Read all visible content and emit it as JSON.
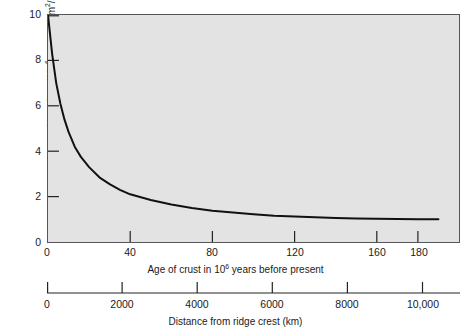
{
  "chart_data": {
    "type": "line",
    "title": "",
    "subtitle": "",
    "xlabel": "Age of crust in 10⁶ years before present",
    "ylabel": "Heat flow (10⁻⁶ calories/cm²/s)",
    "secondary_xlabel": "Distance from ridge crest (km)",
    "xlim": [
      0,
      200
    ],
    "ylim": [
      0,
      10
    ],
    "secondary_xlim": [
      0,
      11000
    ],
    "grid": false,
    "legend": null,
    "plot_background": "#e3e3e3",
    "line_color": "#111111",
    "x_ticks": [
      0,
      40,
      80,
      120,
      160,
      180
    ],
    "x_tick_labels": [
      "0",
      "40",
      "80",
      "120",
      "160",
      "180"
    ],
    "y_ticks": [
      0,
      2,
      4,
      6,
      8,
      10
    ],
    "y_tick_labels": [
      "0",
      "2",
      "4",
      "6",
      "8",
      "10"
    ],
    "secondary_x_ticks": [
      0,
      2000,
      4000,
      6000,
      8000,
      10000
    ],
    "secondary_x_tick_labels": [
      "0",
      "2000",
      "4000",
      "6000",
      "8000",
      "10,000"
    ],
    "series": [
      {
        "name": "Heat flow vs age of crust",
        "x": [
          0,
          2,
          4,
          6,
          8,
          10,
          13,
          16,
          20,
          25,
          30,
          35,
          40,
          50,
          60,
          70,
          80,
          90,
          100,
          110,
          120,
          130,
          140,
          150,
          160,
          170,
          180,
          190
        ],
        "y": [
          10.0,
          8.3,
          7.0,
          6.1,
          5.4,
          4.85,
          4.2,
          3.75,
          3.3,
          2.85,
          2.55,
          2.3,
          2.1,
          1.85,
          1.65,
          1.5,
          1.38,
          1.3,
          1.22,
          1.16,
          1.12,
          1.09,
          1.06,
          1.04,
          1.02,
          1.01,
          1.0,
          1.0
        ]
      }
    ],
    "annotations": []
  },
  "axes": {
    "y": {
      "title_prefix": "Heat flow (10",
      "title_exponent": "−6",
      "title_suffix": " calories/cm",
      "title_exponent2": "2",
      "title_tail": "/s)",
      "ticks": [
        "0",
        "2",
        "4",
        "6",
        "8",
        "10"
      ]
    },
    "age": {
      "title_prefix": "Age of crust in 10",
      "title_exponent": "6",
      "title_suffix": " years before present",
      "zero_label": "0",
      "ticks": [
        "40",
        "80",
        "120",
        "160",
        "180"
      ]
    },
    "distance": {
      "title": "Distance from ridge crest (km)",
      "ticks": [
        "0",
        "2000",
        "4000",
        "6000",
        "8000",
        "10,000"
      ]
    }
  }
}
